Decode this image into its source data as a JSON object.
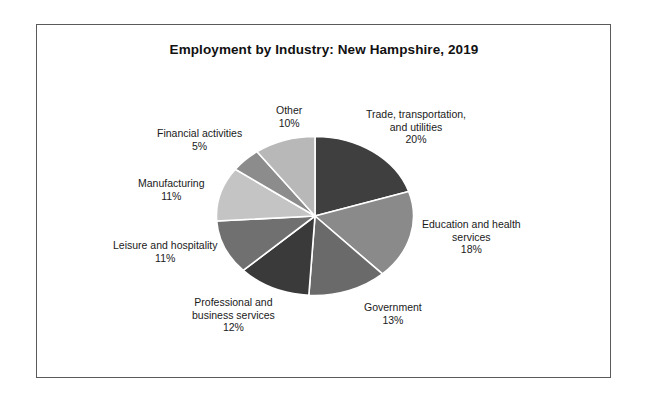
{
  "document": {
    "has_page_border": true,
    "background_color": "#ffffff"
  },
  "chart_data": {
    "type": "pie",
    "title": "Employment by Industry: New Hampshire, 2019",
    "xlabel": "",
    "ylabel": "",
    "legend_position": "none",
    "labels_position": "outside-callout",
    "grid": false,
    "units": "percent",
    "total": 100,
    "categories": [
      "Trade, transportation, and utilities",
      "Education and health services",
      "Government",
      "Professional and business services",
      "Leisure and hospitality",
      "Manufacturing",
      "Financial activities",
      "Other"
    ],
    "values": [
      20,
      18,
      13,
      12,
      11,
      11,
      5,
      10
    ],
    "value_labels": [
      "20%",
      "18%",
      "13%",
      "12%",
      "11%",
      "11%",
      "5%",
      "10%"
    ],
    "colors": [
      "#3f3f3f",
      "#8a8a8a",
      "#6a6a6a",
      "#3a3a3a",
      "#707070",
      "#c4c4c4",
      "#8c8c8c",
      "#b8b8b8"
    ],
    "slice_separator_color": "#ffffff",
    "start_angle_deg": 0,
    "direction": "clockwise"
  },
  "labels": {
    "trade": {
      "line1": "Trade, transportation,",
      "line2": "and utilities",
      "pct": "20%"
    },
    "education": {
      "line1": "Education and health",
      "line2": "services",
      "pct": "18%"
    },
    "government": {
      "line1": "Government",
      "line2": "",
      "pct": "13%"
    },
    "professional": {
      "line1": "Professional and",
      "line2": "business services",
      "pct": "12%"
    },
    "leisure": {
      "line1": "Leisure and hospitality",
      "line2": "",
      "pct": "11%"
    },
    "manufacturing": {
      "line1": "Manufacturing",
      "line2": "",
      "pct": "11%"
    },
    "financial": {
      "line1": "Financial activities",
      "line2": "",
      "pct": "5%"
    },
    "other": {
      "line1": "Other",
      "line2": "",
      "pct": "10%"
    }
  }
}
